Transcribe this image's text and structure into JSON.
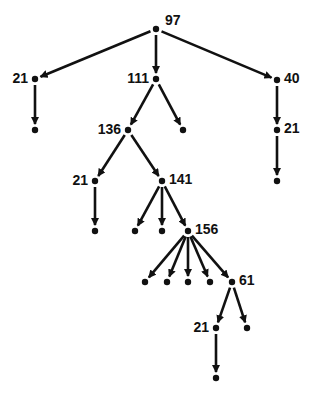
{
  "diagram": {
    "type": "tree",
    "colors": {
      "line": "#111111",
      "node": "#111111",
      "background": "#ffffff"
    },
    "nodes": [
      {
        "id": "n97",
        "label": "97",
        "x": 156,
        "y": 29,
        "label_pos": "top"
      },
      {
        "id": "n21a",
        "label": "21",
        "x": 35,
        "y": 79,
        "label_pos": "left"
      },
      {
        "id": "n111",
        "label": "111",
        "x": 156,
        "y": 79,
        "label_pos": "left"
      },
      {
        "id": "n40",
        "label": "40",
        "x": 277,
        "y": 80,
        "label_pos": "right"
      },
      {
        "id": "l1",
        "label": "",
        "x": 35,
        "y": 130
      },
      {
        "id": "n136",
        "label": "136",
        "x": 128,
        "y": 130,
        "label_pos": "left"
      },
      {
        "id": "l2",
        "label": "",
        "x": 183,
        "y": 130
      },
      {
        "id": "n21b",
        "label": "21",
        "x": 277,
        "y": 130,
        "label_pos": "right"
      },
      {
        "id": "n21c",
        "label": "21",
        "x": 95,
        "y": 181,
        "label_pos": "left"
      },
      {
        "id": "n141",
        "label": "141",
        "x": 162,
        "y": 181,
        "label_pos": "right"
      },
      {
        "id": "l3",
        "label": "",
        "x": 277,
        "y": 181
      },
      {
        "id": "l4",
        "label": "",
        "x": 95,
        "y": 231
      },
      {
        "id": "l5",
        "label": "",
        "x": 135,
        "y": 231
      },
      {
        "id": "l6",
        "label": "",
        "x": 162,
        "y": 231
      },
      {
        "id": "n156",
        "label": "156",
        "x": 188,
        "y": 231,
        "label_pos": "right"
      },
      {
        "id": "l7",
        "label": "",
        "x": 145,
        "y": 282
      },
      {
        "id": "l8",
        "label": "",
        "x": 167,
        "y": 282
      },
      {
        "id": "l9",
        "label": "",
        "x": 188,
        "y": 282
      },
      {
        "id": "l10",
        "label": "",
        "x": 210,
        "y": 282
      },
      {
        "id": "n61",
        "label": "61",
        "x": 232,
        "y": 282,
        "label_pos": "right"
      },
      {
        "id": "n21d",
        "label": "21",
        "x": 216,
        "y": 328,
        "label_pos": "left"
      },
      {
        "id": "l11",
        "label": "",
        "x": 247,
        "y": 328
      },
      {
        "id": "l12",
        "label": "",
        "x": 216,
        "y": 378
      }
    ],
    "edges": [
      [
        "n97",
        "n21a"
      ],
      [
        "n97",
        "n111"
      ],
      [
        "n97",
        "n40"
      ],
      [
        "n21a",
        "l1"
      ],
      [
        "n111",
        "n136"
      ],
      [
        "n111",
        "l2"
      ],
      [
        "n40",
        "n21b"
      ],
      [
        "n21b",
        "l3"
      ],
      [
        "n136",
        "n21c"
      ],
      [
        "n136",
        "n141"
      ],
      [
        "n21c",
        "l4"
      ],
      [
        "n141",
        "l5"
      ],
      [
        "n141",
        "l6"
      ],
      [
        "n141",
        "n156"
      ],
      [
        "n156",
        "l7"
      ],
      [
        "n156",
        "l8"
      ],
      [
        "n156",
        "l9"
      ],
      [
        "n156",
        "l10"
      ],
      [
        "n156",
        "n61"
      ],
      [
        "n61",
        "n21d"
      ],
      [
        "n61",
        "l11"
      ],
      [
        "n21d",
        "l12"
      ]
    ]
  }
}
